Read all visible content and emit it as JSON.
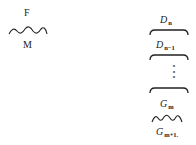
{
  "left_group": {
    "top_label": "F",
    "bottom_label": "M",
    "connector": "wavy-line"
  },
  "right_stack": {
    "items": [
      {
        "base": "D",
        "sub": "n",
        "bracket": "brace-under"
      },
      {
        "base": "D",
        "sub": "n−1",
        "bracket": "brace-under"
      },
      {
        "ellipsis": "⋮",
        "bracket": "brace-under"
      },
      {
        "base": "G",
        "sub": "m",
        "connector": "wavy-line"
      },
      {
        "base": "G",
        "sub": "m+1."
      }
    ]
  }
}
